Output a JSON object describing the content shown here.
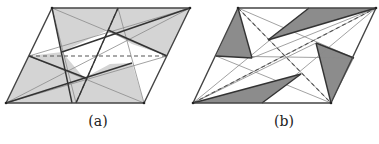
{
  "figure": {
    "panels": [
      {
        "id": "a",
        "label": "(a)",
        "shade_color": "#d4d4d4",
        "outline": [
          [
            6,
            103
          ],
          [
            144,
            103
          ],
          [
            190,
            8
          ],
          [
            52,
            8
          ]
        ],
        "shaded_polygons": [
          [
            [
              52,
              8
            ],
            [
              118,
              8
            ],
            [
              108,
              30
            ],
            [
              62,
              52
            ]
          ],
          [
            [
              118,
              8
            ],
            [
              190,
              8
            ],
            [
              167,
              56
            ],
            [
              132,
              44
            ],
            [
              108,
              30
            ]
          ],
          [
            [
              6,
              103
            ],
            [
              29,
              56
            ],
            [
              62,
              52
            ],
            [
              84,
              78
            ],
            [
              76,
              103
            ]
          ],
          [
            [
              76,
              103
            ],
            [
              144,
              103
            ],
            [
              132,
              63
            ],
            [
              110,
              64
            ],
            [
              84,
              78
            ]
          ]
        ],
        "thin_lines": [
          [
            [
              6,
              103
            ],
            [
              190,
              8
            ]
          ],
          [
            [
              29,
              56
            ],
            [
              190,
              8
            ]
          ],
          [
            [
              6,
              103
            ],
            [
              167,
              56
            ]
          ],
          [
            [
              52,
              8
            ],
            [
              76,
              103
            ]
          ],
          [
            [
              118,
              8
            ],
            [
              144,
              103
            ]
          ],
          [
            [
              52,
              8
            ],
            [
              167,
              56
            ]
          ],
          [
            [
              29,
              56
            ],
            [
              144,
              103
            ]
          ]
        ],
        "thick_lines": [
          [
            [
              52,
              8
            ],
            [
              72,
              103
            ]
          ],
          [
            [
              118,
              8
            ],
            [
              76,
              103
            ]
          ],
          [
            [
              190,
              8
            ],
            [
              62,
              52
            ]
          ],
          [
            [
              6,
              103
            ],
            [
              132,
              63
            ]
          ],
          [
            [
              29,
              56
            ],
            [
              86,
              78
            ]
          ],
          [
            [
              108,
              30
            ],
            [
              167,
              56
            ]
          ]
        ],
        "dashed_lines": [
          [
            [
              29,
              56
            ],
            [
              167,
              56
            ]
          ],
          [
            [
              118,
              8
            ],
            [
              76,
              103
            ]
          ]
        ]
      },
      {
        "id": "b",
        "label": "(b)",
        "shade_color": "#8c8c8c",
        "outline": [
          [
            193,
            103
          ],
          [
            331,
            103
          ],
          [
            376,
            8
          ],
          [
            238,
            8
          ]
        ],
        "shaded_polygons": [
          [
            [
              238,
              8
            ],
            [
              252,
              58
            ],
            [
              216,
              56
            ]
          ],
          [
            [
              309,
              8
            ],
            [
              376,
              8
            ],
            [
              268,
              40
            ]
          ],
          [
            [
              316,
              43
            ],
            [
              354,
              58
            ],
            [
              331,
              103
            ]
          ],
          [
            [
              193,
              103
            ],
            [
              301,
              74
            ],
            [
              262,
              103
            ]
          ]
        ],
        "thin_lines": [
          [
            [
              193,
              103
            ],
            [
              376,
              8
            ]
          ],
          [
            [
              238,
              8
            ],
            [
              331,
              103
            ]
          ],
          [
            [
              216,
              56
            ],
            [
              354,
              58
            ]
          ],
          [
            [
              238,
              8
            ],
            [
              354,
              58
            ]
          ],
          [
            [
              216,
              56
            ],
            [
              331,
              103
            ]
          ],
          [
            [
              193,
              103
            ],
            [
              309,
              8
            ]
          ],
          [
            [
              262,
              103
            ],
            [
              376,
              8
            ]
          ],
          [
            [
              193,
              103
            ],
            [
              316,
              43
            ]
          ],
          [
            [
              252,
              58
            ],
            [
              376,
              8
            ]
          ]
        ],
        "thick_lines": [
          [
            [
              238,
              8
            ],
            [
              252,
              58
            ]
          ],
          [
            [
              216,
              56
            ],
            [
              252,
              58
            ]
          ],
          [
            [
              268,
              40
            ],
            [
              376,
              8
            ]
          ],
          [
            [
              309,
              8
            ],
            [
              268,
              40
            ]
          ],
          [
            [
              316,
              43
            ],
            [
              331,
              103
            ]
          ],
          [
            [
              316,
              43
            ],
            [
              354,
              58
            ]
          ],
          [
            [
              193,
              103
            ],
            [
              301,
              74
            ]
          ],
          [
            [
              262,
              103
            ],
            [
              301,
              74
            ]
          ]
        ],
        "dashed_lines": [
          [
            [
              193,
              103
            ],
            [
              376,
              8
            ]
          ],
          [
            [
              238,
              8
            ],
            [
              331,
              103
            ]
          ]
        ]
      }
    ]
  }
}
